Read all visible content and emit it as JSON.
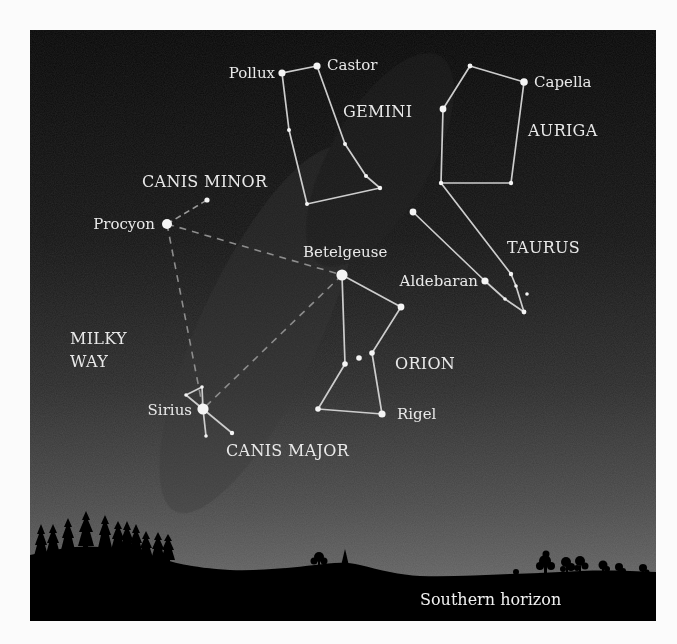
{
  "figure": {
    "colors": {
      "sky_top": "#080808",
      "sky_mid": "#252525",
      "sky_bottom": "#6a6a6a",
      "ground": "#000000",
      "line": "#cfcfcf",
      "dashed_line": "#8a8a8a",
      "text": "#e9e9e9",
      "border": "#fbfbfb"
    }
  },
  "labels": {
    "stars": {
      "pollux": "Pollux",
      "castor": "Castor",
      "capella": "Capella",
      "procyon": "Procyon",
      "betelgeuse": "Betelgeuse",
      "aldebaran": "Aldebaran",
      "rigel": "Rigel",
      "sirius": "Sirius"
    },
    "constellations": {
      "gemini": "GEMINI",
      "auriga": "AURIGA",
      "canis_minor": "CANIS MINOR",
      "taurus": "TAURUS",
      "orion": "ORION",
      "canis_major": "CANIS MAJOR"
    },
    "milky_way_line1": "MILKY",
    "milky_way_line2": "WAY",
    "horizon": "Southern horizon"
  },
  "constellations": [
    {
      "name": "Gemini",
      "bright_stars": [
        "Pollux",
        "Castor"
      ]
    },
    {
      "name": "Auriga",
      "bright_stars": [
        "Capella"
      ]
    },
    {
      "name": "Canis Minor",
      "bright_stars": [
        "Procyon"
      ]
    },
    {
      "name": "Taurus",
      "bright_stars": [
        "Aldebaran"
      ]
    },
    {
      "name": "Orion",
      "bright_stars": [
        "Betelgeuse",
        "Rigel"
      ]
    },
    {
      "name": "Canis Major",
      "bright_stars": [
        "Sirius"
      ]
    }
  ],
  "asterism": {
    "name": "Winter Triangle",
    "vertices": [
      "Procyon",
      "Betelgeuse",
      "Sirius"
    ],
    "style": "dashed"
  }
}
